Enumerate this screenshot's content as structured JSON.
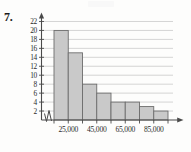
{
  "figure": {
    "problem_number": "7.",
    "background_color": "#fdfdfc"
  },
  "colors": {
    "bar_fill": "#c9c9c9",
    "bar_stroke": "#6d6d6d",
    "gridline": "#b9b9b9",
    "axis": "#4a4a4a",
    "text": "#2a2a2a"
  },
  "chart_data": {
    "type": "bar",
    "title": "",
    "subtitle": "",
    "xlabel": "",
    "ylabel": "",
    "categories": [
      "15,000-25,000",
      "25,000-35,000",
      "35,000-45,000",
      "45,000-55,000",
      "55,000-65,000",
      "65,000-75,000",
      "75,000-85,000",
      "85,000-95,000"
    ],
    "values": [
      20,
      15,
      8,
      6,
      4,
      4,
      3,
      2
    ],
    "bin_edges": [
      15000,
      25000,
      35000,
      45000,
      55000,
      65000,
      75000,
      85000,
      95000
    ],
    "ylim": [
      0,
      23
    ],
    "ytick_values": [
      2,
      4,
      6,
      8,
      10,
      12,
      14,
      16,
      18,
      20,
      22
    ],
    "ytick_labels": [
      "2",
      "4",
      "6",
      "8",
      "10",
      "12",
      "14",
      "16",
      "18",
      "20",
      "22"
    ],
    "xtick_values": [
      25000,
      45000,
      65000,
      85000
    ],
    "xtick_labels": [
      "25,000",
      "45,000",
      "65,000",
      "85,000"
    ],
    "grid": true,
    "grid_axis": "y",
    "legend": null,
    "legend_position": "none",
    "annotations": [],
    "axis_break_x": true,
    "axis_arrows": {
      "x": true,
      "y": true
    }
  }
}
